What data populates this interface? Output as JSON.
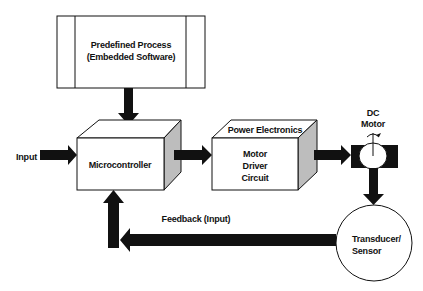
{
  "diagram": {
    "type": "block-diagram",
    "nodes": {
      "predefined_process": {
        "line1": "Predefined Process",
        "line2": "(Embedded Software)"
      },
      "microcontroller": {
        "label": "Microcontroller"
      },
      "power_electronics": {
        "title": "Power Electronics",
        "line1": "Motor",
        "line2": "Driver",
        "line3": "Circuit"
      },
      "dc_motor": {
        "line1": "DC",
        "line2": "Motor"
      },
      "sensor": {
        "line1": "Transducer/",
        "line2": "Sensor"
      }
    },
    "labels": {
      "input": "Input",
      "feedback": "Feedback (Input)"
    },
    "edges": [
      {
        "from": "predefined_process",
        "to": "microcontroller"
      },
      {
        "from": "input",
        "to": "microcontroller"
      },
      {
        "from": "microcontroller",
        "to": "power_electronics"
      },
      {
        "from": "power_electronics",
        "to": "dc_motor"
      },
      {
        "from": "dc_motor",
        "to": "sensor"
      },
      {
        "from": "sensor",
        "to": "microcontroller",
        "label": "Feedback (Input)"
      }
    ],
    "colors": {
      "stroke": "#111111",
      "fill": "#ffffff",
      "side": "#bdbdbd",
      "arrow": "#111111"
    }
  }
}
